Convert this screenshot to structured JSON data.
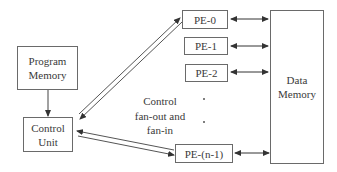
{
  "diagram": {
    "type": "block-diagram",
    "blocks": {
      "program_memory": {
        "line1": "Program",
        "line2": "Memory"
      },
      "control_unit": {
        "line1": "Control",
        "line2": "Unit"
      },
      "data_memory": {
        "line1": "Data",
        "line2": "Memory"
      },
      "pe0": {
        "label": "PE-0"
      },
      "pe1": {
        "label": "PE-1"
      },
      "pe2": {
        "label": "PE-2"
      },
      "pen1": {
        "label": "PE-(n-1)"
      }
    },
    "annotation": {
      "line1": "Control",
      "line2": "fan-out and",
      "line3": "fan-in"
    },
    "ellipsis": ".",
    "edges": [
      {
        "from": "Program Memory",
        "to": "Control Unit",
        "style": "single-arrow"
      },
      {
        "from": "Control Unit",
        "to": "PE-0",
        "style": "double-line-bidirectional"
      },
      {
        "from": "Control Unit",
        "to": "PE-(n-1)",
        "style": "double-line-bidirectional"
      },
      {
        "from": "PE-0",
        "to": "Data Memory",
        "style": "bidirectional-arrow"
      },
      {
        "from": "PE-1",
        "to": "Data Memory",
        "style": "bidirectional-arrow"
      },
      {
        "from": "PE-2",
        "to": "Data Memory",
        "style": "bidirectional-arrow"
      },
      {
        "from": "PE-(n-1)",
        "to": "Data Memory",
        "style": "bidirectional-arrow"
      }
    ],
    "colors": {
      "stroke": "#555555",
      "text": "#3a3a3a",
      "background": "#ffffff"
    }
  }
}
